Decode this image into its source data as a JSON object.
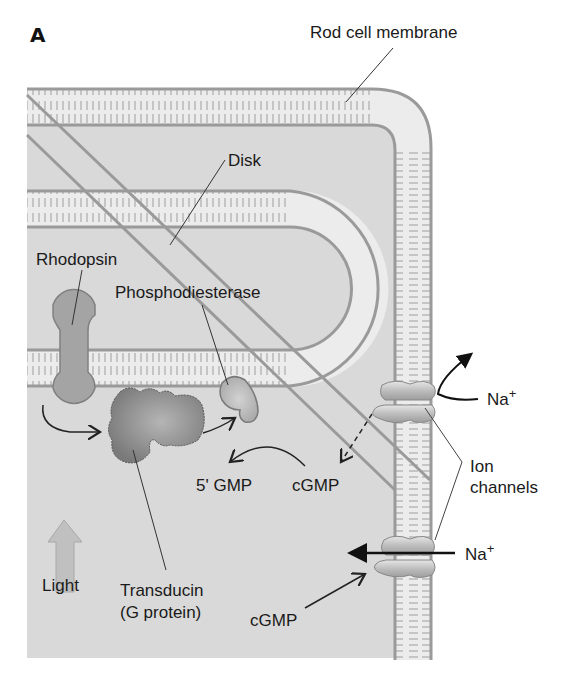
{
  "figure": {
    "panel_label": "A",
    "background_color": "#d9d9d9",
    "membrane_color": "#9a9a9a",
    "bilayer_fill": "#ececec"
  },
  "labels": {
    "rod_cell_membrane": "Rod cell membrane",
    "disk": "Disk",
    "rhodopsin": "Rhodopsin",
    "phosphodiesterase": "Phosphodiesterase",
    "transducin_line1": "Transducin",
    "transducin_line2": "(G protein)",
    "light": "Light",
    "five_gmp": "5' GMP",
    "cgmp_upper": "cGMP",
    "cgmp_lower": "cGMP",
    "na_upper": "Na",
    "na_lower": "Na",
    "na_superscript": "+",
    "ion_channels_line1": "Ion",
    "ion_channels_line2": "channels"
  },
  "icons": {
    "light_arrow": "up-arrow",
    "ion_channel": "channel-protein"
  }
}
